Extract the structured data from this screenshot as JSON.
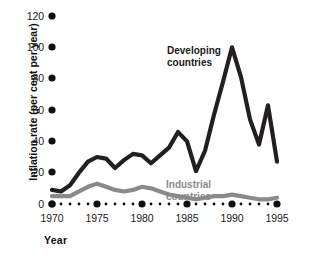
{
  "chart_data": {
    "type": "line",
    "title": "",
    "xlabel": "Year",
    "ylabel": "Inflation rate (per cent per year)",
    "xlim": [
      1970,
      1995
    ],
    "ylim": [
      0,
      120
    ],
    "y_ticks": [
      0,
      20,
      40,
      60,
      80,
      100,
      120
    ],
    "x_ticks": [
      1970,
      1975,
      1980,
      1985,
      1990,
      1995
    ],
    "x_minor_ticks": [
      1971,
      1972,
      1973,
      1974,
      1976,
      1977,
      1978,
      1979,
      1981,
      1982,
      1983,
      1984,
      1986,
      1987,
      1988,
      1989,
      1991,
      1992,
      1993,
      1994
    ],
    "grid": false,
    "legend_position": "inline-annotation",
    "x": [
      1970,
      1971,
      1972,
      1973,
      1974,
      1975,
      1976,
      1977,
      1978,
      1979,
      1980,
      1981,
      1982,
      1983,
      1984,
      1985,
      1986,
      1987,
      1988,
      1989,
      1990,
      1991,
      1992,
      1993,
      1994,
      1995
    ],
    "series": [
      {
        "name": "Developing countries",
        "color": "#231f20",
        "values": [
          9,
          8,
          12,
          20,
          27,
          30,
          29,
          23,
          28,
          32,
          31,
          26,
          31,
          36,
          46,
          40,
          21,
          34,
          57,
          78,
          100,
          81,
          54,
          38,
          63,
          27
        ]
      },
      {
        "name": "Industrial countries",
        "color": "#8a8a8a",
        "values": [
          5,
          5,
          5,
          8,
          11,
          13,
          11,
          9,
          8,
          9,
          11,
          10,
          8,
          6,
          5,
          4,
          3,
          4,
          5,
          5,
          6,
          5,
          4,
          3,
          3,
          4
        ]
      }
    ],
    "annotations": [
      {
        "text": "Developing countries",
        "series": "Developing countries"
      },
      {
        "text": "Industrial countries",
        "series": "Industrial countries"
      }
    ]
  },
  "axis": {
    "y_tick_labels": [
      "120",
      "100",
      "80",
      "60",
      "40",
      "20",
      "0"
    ],
    "x_tick_labels": [
      "1970",
      "1975",
      "1980",
      "1985",
      "1990",
      "1995"
    ],
    "y_title": "Inflation rate (per cent per year)",
    "x_title": "Year"
  },
  "labels": {
    "developing_line1": "Developing",
    "developing_line2": "countries",
    "industrial_line1": "Industrial",
    "industrial_line2": "countries"
  },
  "colors": {
    "developing": "#231f20",
    "industrial": "#8a8a8a",
    "tick_dot": "#111111",
    "background": "#ffffff"
  }
}
